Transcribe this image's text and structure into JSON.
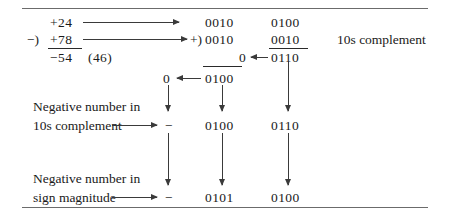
{
  "figure": {
    "title_none": "",
    "decimal_block": {
      "augend": "+24",
      "subtract_sign": "−)",
      "subtrahend": "+78",
      "result": "−54",
      "result_alt": "(46)"
    },
    "binary_block": {
      "plus_sign": "+)",
      "row1": {
        "high": "0010",
        "low": "0100"
      },
      "row2": {
        "high": "0010",
        "low": "0010"
      },
      "row3": {
        "carry": "0",
        "low": "0110"
      },
      "note": "10s complement"
    },
    "carry_row": {
      "carry": "0",
      "value": "0100"
    },
    "tens_complement_row": {
      "label_line1": "Negative number in",
      "label_line2": "10s complement",
      "sign": "−",
      "high": "0100",
      "low": "0110"
    },
    "sign_magnitude_row": {
      "label_line1": "Negative number in",
      "label_line2": "sign magnitude",
      "sign": "−",
      "high": "0101",
      "low": "0100"
    },
    "colors": {
      "ink": "#1a1a1a",
      "rule": "#6b6b6b",
      "arrow": "#3a3a3a",
      "background": "#ffffff"
    }
  }
}
